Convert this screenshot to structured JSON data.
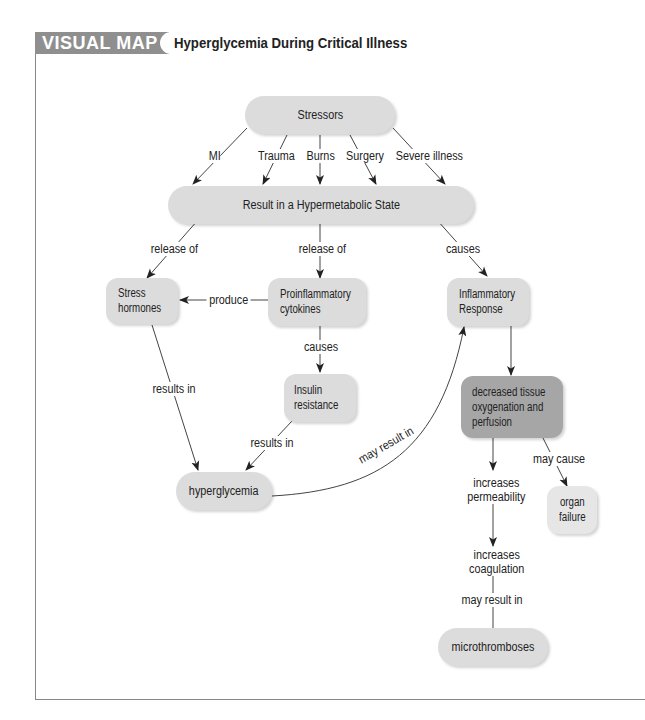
{
  "header": {
    "badge": "VISUAL MAP",
    "title": "Hyperglycemia During Critical Illness"
  },
  "nodes": {
    "stressors": "Stressors",
    "hypermetabolic": "Result in a Hypermetabolic State",
    "stress_hormones": [
      "Stress",
      "hormones"
    ],
    "cytokines": [
      "Proinflammatory",
      "cytokines"
    ],
    "inflammatory_response": [
      "Inflammatory",
      "Response"
    ],
    "insulin_resistance": [
      "Insulin",
      "resistance"
    ],
    "hyperglycemia": "hyperglycemia",
    "decreased_tissue": [
      "decreased tissue",
      "oxygenation and",
      "perfusion"
    ],
    "organ_failure": [
      "organ",
      "failure"
    ],
    "microthromboses": "microthromboses"
  },
  "edges": {
    "stressor_types": [
      "MI",
      "Trauma",
      "Burns",
      "Surgery",
      "Severe illness"
    ],
    "release_of_1": "release of",
    "release_of_2": "release of",
    "causes_1": "causes",
    "produce": "produce",
    "causes_2": "causes",
    "results_in_1": "results in",
    "results_in_2": "results in",
    "may_result_in_1": "may result in",
    "may_cause": "may cause",
    "increases_permeability": [
      "increases",
      "permeability"
    ],
    "increases_coagulation": [
      "increases",
      "coagulation"
    ],
    "may_result_in_2": "may result in"
  },
  "colors": {
    "header_bar": "#8f8f8f",
    "node_fill": "#dcdcdc",
    "node_dark_fill": "#a6a6a6",
    "line": "#333333"
  }
}
